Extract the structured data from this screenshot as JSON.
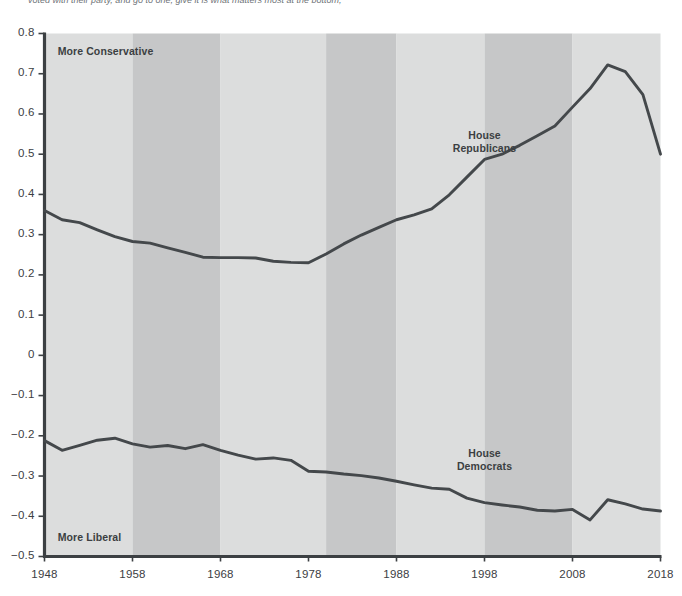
{
  "page": {
    "top_cut_text": "voted with their party, and go to one, give it is what matters most at the bottom,"
  },
  "chart_data": {
    "type": "line",
    "title": "",
    "xlabel": "",
    "ylabel": "",
    "xlim": [
      1948,
      2018
    ],
    "ylim": [
      -0.5,
      0.8
    ],
    "grid": false,
    "legend_position": "inline-annotation",
    "y_ticks": [
      "0.8",
      "0.7",
      "0.6",
      "0.5",
      "0.4",
      "0.3",
      "0.2",
      "0.1",
      "0",
      "−0.1",
      "−0.2",
      "−0.3",
      "−0.4",
      "−0.5"
    ],
    "y_tick_values": [
      0.8,
      0.7,
      0.6,
      0.5,
      0.4,
      0.3,
      0.2,
      0.1,
      0,
      -0.1,
      -0.2,
      -0.3,
      -0.4,
      -0.5
    ],
    "x_ticks": [
      "1948",
      "1958",
      "1968",
      "1978",
      "1988",
      "1998",
      "2008",
      "2018"
    ],
    "x_tick_values": [
      1948,
      1958,
      1968,
      1978,
      1988,
      1998,
      2008,
      2018
    ],
    "annotations": [
      {
        "name": "more-conservative",
        "text": "More Conservative",
        "x": 1949.5,
        "y": 0.755
      },
      {
        "name": "more-liberal",
        "text": "More Liberal",
        "x": 1949.5,
        "y": -0.455
      },
      {
        "name": "house-republicans",
        "text": "House\nRepublicans",
        "line1": "House",
        "line2": "Republicans",
        "x": 1998,
        "y": 0.545
      },
      {
        "name": "house-democrats",
        "text": "House\nDemocrats",
        "line1": "House",
        "line2": "Democrats",
        "x": 1998,
        "y": -0.245
      }
    ],
    "bands": [
      {
        "x0": 1948,
        "x1": 1958,
        "shade": "light"
      },
      {
        "x0": 1958,
        "x1": 1968,
        "shade": "dark"
      },
      {
        "x0": 1968,
        "x1": 1980,
        "shade": "light"
      },
      {
        "x0": 1980,
        "x1": 1988,
        "shade": "dark"
      },
      {
        "x0": 1988,
        "x1": 1998,
        "shade": "light"
      },
      {
        "x0": 1998,
        "x1": 2008,
        "shade": "dark"
      },
      {
        "x0": 2008,
        "x1": 2018,
        "shade": "light"
      }
    ],
    "x": [
      1948,
      1950,
      1952,
      1954,
      1956,
      1958,
      1960,
      1962,
      1964,
      1966,
      1968,
      1970,
      1972,
      1974,
      1976,
      1978,
      1980,
      1982,
      1984,
      1986,
      1988,
      1990,
      1992,
      1994,
      1996,
      1998,
      2000,
      2002,
      2004,
      2006,
      2008,
      2010,
      2012,
      2014,
      2016,
      2018
    ],
    "series": [
      {
        "name": "House Republicans",
        "color": "#44484b",
        "values": [
          0.36,
          0.337,
          0.33,
          0.312,
          0.295,
          0.283,
          0.279,
          0.267,
          0.256,
          0.244,
          0.243,
          0.243,
          0.242,
          0.234,
          0.231,
          0.23,
          0.252,
          0.277,
          0.299,
          0.318,
          0.337,
          0.349,
          0.364,
          0.399,
          0.443,
          0.487,
          0.5,
          0.522,
          0.546,
          0.57,
          0.617,
          0.663,
          0.722,
          0.705,
          0.648,
          0.5
        ]
      },
      {
        "name": "House Democrats",
        "color": "#44484b",
        "values": [
          -0.212,
          -0.236,
          -0.224,
          -0.211,
          -0.206,
          -0.22,
          -0.228,
          -0.224,
          -0.232,
          -0.222,
          -0.236,
          -0.248,
          -0.258,
          -0.255,
          -0.261,
          -0.288,
          -0.29,
          -0.295,
          -0.299,
          -0.305,
          -0.313,
          -0.322,
          -0.33,
          -0.333,
          -0.355,
          -0.366,
          -0.372,
          -0.377,
          -0.385,
          -0.387,
          -0.383,
          -0.409,
          -0.359,
          -0.369,
          -0.382,
          -0.387
        ]
      }
    ],
    "colors": {
      "band_light": "#dcdddd",
      "band_dark": "#c6c7c8",
      "axis": "#3c4043",
      "line": "#44484b",
      "text": "#3c4043",
      "background": "#ffffff"
    }
  }
}
